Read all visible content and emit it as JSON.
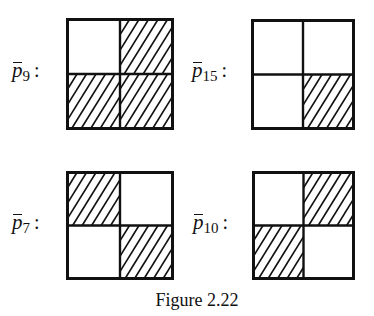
{
  "figure": {
    "caption": "Figure 2.22",
    "hatch_color": "#111111",
    "line_color": "#111111",
    "panels": [
      {
        "id": "p9",
        "label_base": "p",
        "label_sub": "9",
        "label_colon": ":",
        "cells": {
          "top_left": "empty",
          "top_right": "hatched",
          "bottom_left": "hatched",
          "bottom_right": "hatched"
        }
      },
      {
        "id": "p15",
        "label_base": "p",
        "label_sub": "15",
        "label_colon": ":",
        "cells": {
          "top_left": "empty",
          "top_right": "empty",
          "bottom_left": "empty",
          "bottom_right": "hatched"
        }
      },
      {
        "id": "p7",
        "label_base": "p",
        "label_sub": "7",
        "label_colon": ":",
        "cells": {
          "top_left": "hatched",
          "top_right": "empty",
          "bottom_left": "empty",
          "bottom_right": "hatched"
        }
      },
      {
        "id": "p10",
        "label_base": "p",
        "label_sub": "10",
        "label_colon": ":",
        "cells": {
          "top_left": "empty",
          "top_right": "hatched",
          "bottom_left": "hatched",
          "bottom_right": "empty"
        }
      }
    ]
  }
}
